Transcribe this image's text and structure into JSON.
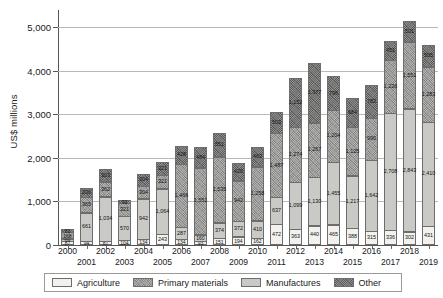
{
  "chart_data": {
    "type": "bar",
    "subtype": "stacked-vertical",
    "title": "",
    "xlabel": "",
    "ylabel": "US$ millions",
    "ylim": [
      0,
      5400
    ],
    "yticks": [
      0,
      1000,
      2000,
      3000,
      4000,
      5000
    ],
    "ytick_labels": [
      "0",
      "1,000",
      "2,000",
      "3,000",
      "4,000",
      "5,000"
    ],
    "grid": true,
    "legend_position": "bottom",
    "stack_order_bottom_to_top": [
      "Agriculture",
      "Manufactures",
      "Primary materials",
      "Other"
    ],
    "categories": [
      "2000",
      "2001",
      "2002",
      "2003",
      "2004",
      "2005",
      "2006",
      "2007",
      "2008",
      "2009",
      "2010",
      "2011",
      "2012",
      "2013",
      "2014",
      "2015",
      "2016",
      "2017",
      "2018",
      "2019"
    ],
    "series": [
      {
        "name": "Agriculture",
        "color": "#f2f1ee",
        "values": [
          87,
          94,
          87,
          104,
          134,
          243,
          134,
          93,
          151,
          194,
          162,
          472,
          363,
          440,
          465,
          388,
          315,
          336,
          302,
          431
        ]
      },
      {
        "name": "Manufactures",
        "color": "#c9c9c6",
        "values": [
          69,
          661,
          1034,
          570,
          942,
          1064,
          287,
          160,
          374,
          372,
          410,
          637,
          1099,
          1130,
          1455,
          1217,
          1642,
          2708,
          2843,
          2410
        ]
      },
      {
        "name": "Primary materials",
        "color": "#9a9a98",
        "values": [
          168,
          365,
          362,
          321,
          304,
          321,
          1466,
          1551,
          1535,
          942,
          1258,
          1487,
          1274,
          1267,
          1204,
          1125,
          990,
          1226,
          1551,
          1283
        ]
      },
      {
        "name": "Other",
        "color": "#6f6f6e",
        "values": [
          81,
          236,
          303,
          92,
          304,
          321,
          428,
          484,
          551,
          420,
          463,
          503,
          1152,
          1377,
          796,
          684,
          782,
          451,
          501,
          505
        ]
      }
    ],
    "data_labels": {
      "2000": {
        "Agriculture": "87",
        "Manufactures": "69",
        "Primary materials": "168",
        "Other": "81"
      },
      "2001": {
        "Agriculture": "94",
        "Manufactures": "661",
        "Primary materials": "365",
        "Other": "236"
      },
      "2002": {
        "Agriculture": "87",
        "Manufactures": "1,034",
        "Primary materials": "362",
        "Other": "303"
      },
      "2003": {
        "Agriculture": "104",
        "Manufactures": "570",
        "Primary materials": "321",
        "Other": "92"
      },
      "2004": {
        "Agriculture": "134",
        "Manufactures": "942",
        "Primary materials": "304",
        "Other": "304"
      },
      "2005": {
        "Agriculture": "243",
        "Manufactures": "1,064",
        "Primary materials": "321",
        "Other": "321"
      },
      "2006": {
        "Agriculture": "134",
        "Manufactures": "287",
        "Primary materials": "1,466",
        "Other": "428"
      },
      "2007": {
        "Agriculture": "93",
        "Manufactures": "160",
        "Primary materials": "1,551",
        "Other": "484"
      },
      "2008": {
        "Agriculture": "151",
        "Manufactures": "374",
        "Primary materials": "1,535",
        "Other": "551"
      },
      "2009": {
        "Agriculture": "194",
        "Manufactures": "372",
        "Primary materials": "942",
        "Other": "420"
      },
      "2010": {
        "Agriculture": "162",
        "Manufactures": "410",
        "Primary materials": "1,258",
        "Other": "463"
      },
      "2011": {
        "Agriculture": "472",
        "Manufactures": "637",
        "Primary materials": "1,487",
        "Other": "503"
      },
      "2012": {
        "Agriculture": "363",
        "Manufactures": "1,099",
        "Primary materials": "1,274",
        "Other": "1,152"
      },
      "2013": {
        "Agriculture": "440",
        "Manufactures": "1,130",
        "Primary materials": "1,267",
        "Other": "1,377"
      },
      "2014": {
        "Agriculture": "465",
        "Manufactures": "1,455",
        "Primary materials": "1,204",
        "Other": "796"
      },
      "2015": {
        "Agriculture": "388",
        "Manufactures": "1,217",
        "Primary materials": "1,125",
        "Other": "684"
      },
      "2016": {
        "Agriculture": "315",
        "Manufactures": "1,642",
        "Primary materials": "990",
        "Other": "782"
      },
      "2017": {
        "Agriculture": "336",
        "Manufactures": "2,708",
        "Primary materials": "1,226",
        "Other": "451"
      },
      "2018": {
        "Agriculture": "302",
        "Manufactures": "2,843",
        "Primary materials": "1,551",
        "Other": "501"
      },
      "2019": {
        "Agriculture": "431",
        "Manufactures": "2,410",
        "Primary materials": "1,283",
        "Other": "505"
      }
    }
  },
  "legend": {
    "items": [
      {
        "label": "Agriculture",
        "color": "#f2f1ee"
      },
      {
        "label": "Primary materials",
        "color": "#9a9a98"
      },
      {
        "label": "Manufactures",
        "color": "#c9c9c6"
      },
      {
        "label": "Other",
        "color": "#6f6f6e"
      }
    ]
  }
}
